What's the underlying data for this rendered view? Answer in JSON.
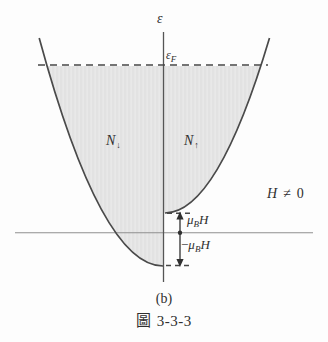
{
  "figure": {
    "axis": {
      "energy_label": "ε"
    },
    "fermi_level": {
      "base": "ε",
      "sub": "F"
    },
    "bands": {
      "spin_down": {
        "base": "N",
        "sub": "↓"
      },
      "spin_up": {
        "base": "N",
        "sub": "↑"
      }
    },
    "field_condition": {
      "h": "H",
      "relation": "≠",
      "zero": "0"
    },
    "zeeman_shift": {
      "up": {
        "mu": "μ",
        "sub": "B",
        "h": "H"
      },
      "down": {
        "minus": "−",
        "mu": "μ",
        "sub": "B",
        "h": "H"
      }
    },
    "caption": {
      "panel": "(b)",
      "fig_word": "圖",
      "fig_number": "3-3-3"
    },
    "colors": {
      "shade": "#e2e2e2",
      "shade_stripe": "#ececec",
      "curve": "#4a4a4a",
      "axis_v": "#555555",
      "axis_h": "#8f8f8f",
      "dash": "#474747",
      "marker": "#303030",
      "text": "#2f2f2f"
    }
  }
}
